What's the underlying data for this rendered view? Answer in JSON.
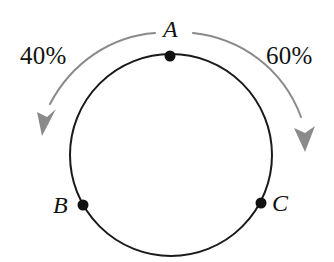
{
  "figure": {
    "kind": "circle-diagram",
    "width": 334,
    "height": 262,
    "background_color": "#ffffff"
  },
  "circle": {
    "center_x": 171,
    "center_y": 155,
    "radius": 101,
    "stroke_color": "#1a1a1a",
    "stroke_width": 2,
    "fill": "none"
  },
  "points": [
    {
      "id": "A",
      "label": "A",
      "x": 170,
      "y": 56,
      "marker_radius": 5,
      "marker_color": "#111111",
      "label_position": "above"
    },
    {
      "id": "B",
      "label": "B",
      "x": 83,
      "y": 205,
      "marker_radius": 5,
      "marker_color": "#111111",
      "label_position": "left"
    },
    {
      "id": "C",
      "label": "C",
      "x": 261,
      "y": 203,
      "marker_radius": 5,
      "marker_color": "#111111",
      "label_position": "right"
    }
  ],
  "arrows": [
    {
      "id": "left-arrow",
      "direction": "counterclockwise",
      "label": "40%",
      "color": "#8a8a8a",
      "stroke_width": 2,
      "path": "M 155 33 C 112 36 72 62 50 104",
      "tip_x": 42,
      "tip_y": 134
    },
    {
      "id": "right-arrow",
      "direction": "clockwise",
      "label": "60%",
      "color": "#8a8a8a",
      "stroke_width": 2,
      "path": "M 193 33 C 240 38 283 68 301 117",
      "tip_x": 305,
      "tip_y": 149
    }
  ],
  "labels": {
    "percent_left": "40%",
    "percent_right": "60%",
    "point_a": "A",
    "point_b": "B",
    "point_c": "C"
  }
}
